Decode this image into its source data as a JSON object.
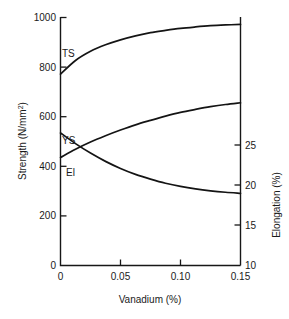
{
  "chart_data": {
    "type": "line",
    "title": "",
    "xlabel": "Vanadium (%)",
    "ylabel": "Strength (N/mm²)",
    "y2label": "Elongation (%)",
    "xlim": [
      0,
      0.15
    ],
    "ylim": [
      0,
      1000
    ],
    "y2lim": [
      10,
      31
    ],
    "grid": false,
    "legend": "inline-labels",
    "xticks": [
      0,
      0.05,
      0.1,
      0.15
    ],
    "xticklabels": [
      "0",
      "0.05",
      "0.10",
      "0.15"
    ],
    "yticks": [
      0,
      200,
      400,
      600,
      800,
      1000
    ],
    "yticklabels": [
      "0",
      "200",
      "400",
      "600",
      "800",
      "1000"
    ],
    "y2ticks": [
      10,
      15,
      20,
      25
    ],
    "y2ticklabels": [
      "10",
      "15",
      "20",
      "25"
    ],
    "x": [
      0,
      0.0125,
      0.025,
      0.0375,
      0.05,
      0.0625,
      0.075,
      0.0875,
      0.1,
      0.1125,
      0.125,
      0.1375,
      0.15
    ],
    "series": [
      {
        "name": "TS",
        "label": "TS",
        "axis": "left",
        "unit": "N/mm²",
        "values": [
          770,
          825,
          862,
          888,
          908,
          924,
          937,
          946,
          954,
          960,
          965,
          968,
          970
        ]
      },
      {
        "name": "YS",
        "label": "YS",
        "axis": "left",
        "unit": "N/mm²",
        "values": [
          435,
          468,
          497,
          522,
          545,
          566,
          584,
          601,
          616,
          628,
          639,
          648,
          655
        ]
      },
      {
        "name": "El",
        "label": "El",
        "axis": "right",
        "unit": "%",
        "values": [
          21.2,
          20.3,
          19.5,
          18.8,
          18.2,
          17.7,
          17.3,
          16.95,
          16.68,
          16.47,
          16.31,
          16.19,
          16.1
        ]
      }
    ],
    "colors": {
      "curve": "#141414",
      "axis": "#171717",
      "text": "#1a1a1a",
      "background": "#ffffff"
    }
  },
  "labels": {
    "ts": "TS",
    "ys": "YS",
    "el": "El",
    "ylabel_main": "Strength (N/mm",
    "ylabel_sup": "2",
    "ylabel_close": ")",
    "y2label": "Elongation (%)",
    "xlabel": "Vanadium (%)"
  }
}
